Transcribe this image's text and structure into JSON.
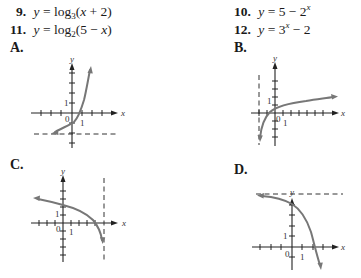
{
  "problems": [
    {
      "number": "9.",
      "lhs": "y",
      "func": "log",
      "base": "3",
      "arg": "(x + 2)",
      "text": "y = log3(x + 2)"
    },
    {
      "number": "10.",
      "lhs": "y",
      "pre": "5 − 2",
      "exp": "x",
      "post": "",
      "text": "y = 5 − 2^x"
    },
    {
      "number": "11.",
      "lhs": "y",
      "func": "log",
      "base": "2",
      "arg": "(5 − x)",
      "text": "y = log2(5 − x)"
    },
    {
      "number": "12.",
      "lhs": "y",
      "pre": "3",
      "exp": "x",
      "post": " − 2",
      "text": "y = 3^x − 2"
    }
  ],
  "graphs": [
    {
      "label": "A.",
      "description": "Increasing exponential curve with horizontal asymptote y = -2, y-intercept near -1",
      "asymptote": "horizontal dashed line at y = -2",
      "axis_labels": {
        "x": "x",
        "y": "y",
        "origin": "0",
        "x_tick": "1",
        "y_tick": "1"
      }
    },
    {
      "label": "B.",
      "description": "Increasing logarithmic curve with vertical asymptote x = -2",
      "asymptote": "vertical dashed line at x = -2",
      "axis_labels": {
        "x": "x",
        "y": "y",
        "origin": "0",
        "x_tick": "1",
        "y_tick": "1"
      }
    },
    {
      "label": "C.",
      "description": "Decreasing logarithmic curve with vertical asymptote x = 5",
      "asymptote": "vertical dashed line at x = 5",
      "axis_labels": {
        "x": "x",
        "y": "y",
        "origin": "0",
        "x_tick": "1",
        "y_tick": "1"
      }
    },
    {
      "label": "D.",
      "description": "Decreasing exponential curve with horizontal asymptote y = 5, y-intercept 4",
      "asymptote": "horizontal dashed line at y = 5",
      "axis_labels": {
        "x": "x",
        "y": "y",
        "origin": "0",
        "x_tick": "1",
        "y_tick": "1"
      }
    }
  ],
  "colors": {
    "curve": "#777777",
    "axis": "#222222",
    "text": "#1a1a1a"
  }
}
